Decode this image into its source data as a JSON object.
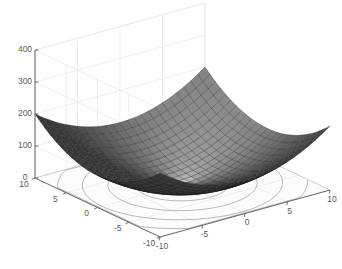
{
  "figure": {
    "type": "surface-plot-3d",
    "background_color": "#ffffff",
    "axes_color": "#5a5a5a",
    "grid_color": "#e6e6e6",
    "surface_dark_color": "#4d4d4d",
    "surface_light_color": "#b5b5b5",
    "mesh_line_color": "#1a1a1a",
    "contour_color": "#8c8c8c"
  },
  "chart_data": {
    "type": "surface",
    "title": "",
    "xlabel": "",
    "ylabel": "",
    "zlabel": "",
    "function": "z = x^2 + y^2",
    "xlim": [
      -10,
      10
    ],
    "ylim": [
      -10,
      10
    ],
    "zlim": [
      0,
      400
    ],
    "grid": true,
    "legend": "none",
    "colormap": "gray",
    "contour_projection": true,
    "x_ticks": [
      -10,
      -5,
      0,
      5,
      10
    ],
    "y_ticks": [
      -10,
      -5,
      0,
      5,
      10
    ],
    "z_ticks": [
      0,
      100,
      200,
      300,
      400
    ],
    "x_ticklabels": [
      "-10",
      "-5",
      "0",
      "5",
      "10"
    ],
    "y_ticklabels": [
      "10",
      "5",
      "0",
      "-5",
      "-10"
    ],
    "z_ticklabels": [
      "0",
      "100",
      "200",
      "300",
      "400"
    ],
    "mesh_steps": 24,
    "contour_levels": [
      20,
      50,
      90,
      140,
      200,
      270,
      340,
      400
    ],
    "view": {
      "azimuth": -37.5,
      "elevation": 30
    },
    "x": [
      -10,
      -9.167,
      -8.333,
      -7.5,
      -6.667,
      -5.833,
      -5,
      -4.167,
      -3.333,
      -2.5,
      -1.667,
      -0.833,
      0,
      0.833,
      1.667,
      2.5,
      3.333,
      4.167,
      5,
      5.833,
      6.667,
      7.5,
      8.333,
      9.167,
      10
    ],
    "y": [
      -10,
      -9.167,
      -8.333,
      -7.5,
      -6.667,
      -5.833,
      -5,
      -4.167,
      -3.333,
      -2.5,
      -1.667,
      -0.833,
      0,
      0.833,
      1.667,
      2.5,
      3.333,
      4.167,
      5,
      5.833,
      6.667,
      7.5,
      8.333,
      9.167,
      10
    ],
    "z_corner_values": {
      "x-10_y-10": 200,
      "x-10_y10": 200,
      "x10_y-10": 200,
      "x10_y10": 200,
      "x0_y0": 0,
      "x-10_y0": 100,
      "x0_y-10": 100
    }
  }
}
